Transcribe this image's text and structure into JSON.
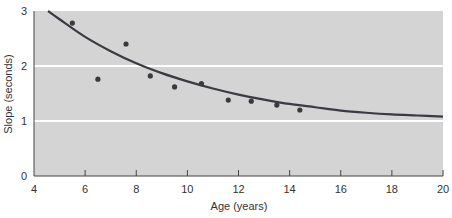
{
  "chart_data": {
    "type": "scatter",
    "title": "",
    "xlabel": "Age (years)",
    "ylabel": "Slope (seconds)",
    "xlim": [
      4,
      20
    ],
    "ylim": [
      0,
      3
    ],
    "xticks": [
      4,
      6,
      8,
      10,
      12,
      14,
      16,
      18,
      20
    ],
    "yticks": [
      0,
      1,
      2,
      3
    ],
    "grid": {
      "horizontal": true,
      "vertical": false,
      "color": "#ffffff"
    },
    "legend": null,
    "series": [
      {
        "name": "Observed",
        "kind": "scatter",
        "x": [
          5.5,
          6.5,
          7.6,
          8.55,
          9.5,
          10.55,
          11.6,
          12.5,
          13.5,
          14.4
        ],
        "y": [
          2.78,
          1.76,
          2.4,
          1.82,
          1.62,
          1.68,
          1.38,
          1.36,
          1.29,
          1.2
        ]
      },
      {
        "name": "Fitted curve",
        "kind": "line",
        "x": [
          4.55,
          5,
          6,
          7,
          8,
          9,
          10,
          11,
          12,
          13,
          14,
          15,
          16,
          17,
          18,
          19,
          20
        ],
        "y": [
          3.0,
          2.85,
          2.53,
          2.27,
          2.05,
          1.87,
          1.72,
          1.59,
          1.48,
          1.39,
          1.31,
          1.25,
          1.19,
          1.15,
          1.12,
          1.1,
          1.08
        ]
      }
    ]
  },
  "colors": {
    "plot_background": "#d4d4d4",
    "gridline": "#ffffff",
    "curve": "#3a3a42",
    "points": "#3a3a3a",
    "axis": "#444444",
    "text": "#333333"
  }
}
